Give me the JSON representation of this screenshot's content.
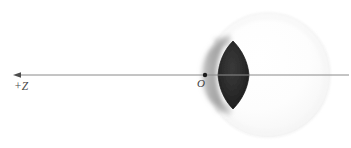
{
  "figure": {
    "domain": "diagram",
    "canvas": {
      "width": 351,
      "height": 148,
      "background": "#ffffff"
    }
  },
  "labels": {
    "axis_direction": "+Z",
    "origin": "O"
  },
  "axis": {
    "name": "optical-axis",
    "color": "#8a8a8a",
    "stroke_width": 1,
    "y": 75,
    "x_start": 14,
    "x_end": 349,
    "arrow_at": "left",
    "arrow_color": "#4d4d4d",
    "label_text": "+Z",
    "label_x": 14,
    "label_y": 89
  },
  "origin_point": {
    "name": "origin-marker",
    "x": 205,
    "y": 75,
    "radius": 2.2,
    "color": "#1a1a1a",
    "label_text": "O",
    "label_x": 197,
    "label_y": 86
  },
  "eyeball": {
    "name": "eyeball-sphere",
    "center_x": 268,
    "center_y": 75,
    "radius": 62,
    "fill": "#fcfcfc",
    "outline": "#ededed",
    "outline_width": 1
  },
  "cornea": {
    "name": "cornea-crescent",
    "fill": "#9a9a9a",
    "opacity": 0.78,
    "blur": 2.2,
    "x_left": 203,
    "x_right": 231,
    "y_top": 37,
    "y_bottom": 112
  },
  "lens": {
    "name": "crystalline-lens",
    "fill": "#262626",
    "edge": "#141414",
    "x_left": 218,
    "x_right": 249,
    "y_top": 41,
    "y_bottom": 109,
    "center_x": 233,
    "center_y": 75
  },
  "colors": {
    "background": "#ffffff",
    "axis": "#8a8a8a",
    "text": "#3d3d3d",
    "lens_dark": "#262626",
    "cornea_gray": "#9a9a9a",
    "sphere_pale": "#fcfcfc"
  }
}
